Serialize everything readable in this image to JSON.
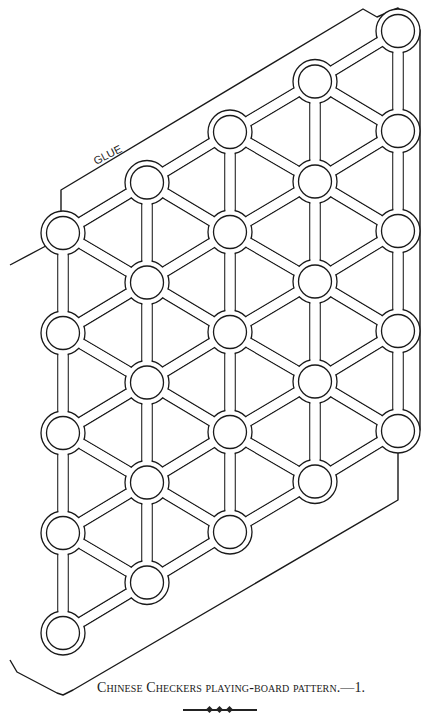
{
  "figure": {
    "glue_label": "GLUE",
    "caption": "Chinese Checkers playing-board pattern.—1."
  },
  "board": {
    "stroke_color": "#1a1a1a",
    "background": "#ffffff",
    "columns_x": [
      63,
      147,
      230,
      315,
      398
    ],
    "bottom_y": 633,
    "row_step": 100,
    "col_rise": 50.5,
    "rows_per_column": 5,
    "hole_inner_radius": 16.5,
    "hole_outer_radius": 22,
    "bar_half_width": 4.5,
    "outline_points": [
      [
        10,
        265
      ],
      [
        42,
        248
      ],
      [
        61,
        238
      ],
      [
        61,
        190
      ],
      [
        363,
        9
      ],
      [
        377,
        17
      ],
      [
        398,
        8
      ],
      [
        420,
        30
      ],
      [
        420,
        430
      ],
      [
        398,
        452
      ],
      [
        398,
        500
      ],
      [
        73,
        690
      ],
      [
        63,
        695
      ],
      [
        57,
        693
      ],
      [
        17,
        672
      ],
      [
        10,
        660
      ]
    ]
  }
}
